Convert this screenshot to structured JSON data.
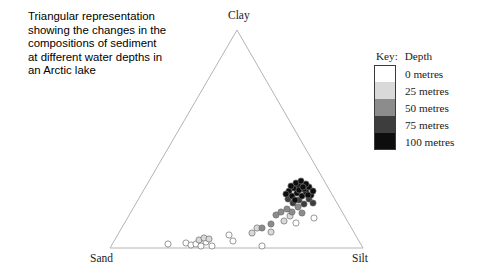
{
  "caption": {
    "lines": [
      "Triangular representation",
      "showing the changes in the",
      "compositions of sediment",
      "at different water depths in",
      "an Arctic lake"
    ]
  },
  "legend": {
    "key_label": "Key:",
    "title": "Depth",
    "entries": [
      {
        "label": "0 metres",
        "color": "#ffffff"
      },
      {
        "label": "25 metres",
        "color": "#d9d9d9"
      },
      {
        "label": "50 metres",
        "color": "#8c8c8c"
      },
      {
        "label": "75 metres",
        "color": "#3d3d3d"
      },
      {
        "label": "100 metres",
        "color": "#0d0d0d"
      }
    ]
  },
  "chart_data": {
    "type": "scatter",
    "title": "Triangular representation showing the changes in the compositions of sediment at different water depths in an Arctic lake",
    "subtype": "ternary",
    "axes": {
      "top": "Clay",
      "bottom_left": "Sand",
      "bottom_right": "Silt"
    },
    "vertex_labels": {
      "clay": "Clay",
      "sand": "Sand",
      "silt": "Silt"
    },
    "geometry": {
      "apex": [
        237,
        30
      ],
      "left": [
        110,
        248
      ],
      "right": [
        363,
        248
      ],
      "stroke": "#b4b4b4",
      "stroke_width": 1
    },
    "legend_position": "top-right",
    "grid": false,
    "marker": {
      "shape": "circle",
      "radius": 3.1,
      "edge": "#6b6b6b"
    },
    "series": [
      {
        "name": "0 metres",
        "color": "#ffffff",
        "points": [
          {
            "x": 168,
            "y": 244
          },
          {
            "x": 186,
            "y": 243
          },
          {
            "x": 191,
            "y": 245
          },
          {
            "x": 196,
            "y": 244
          },
          {
            "x": 201,
            "y": 246
          },
          {
            "x": 206,
            "y": 242
          },
          {
            "x": 212,
            "y": 246
          },
          {
            "x": 233,
            "y": 241
          },
          {
            "x": 229,
            "y": 235
          },
          {
            "x": 262,
            "y": 246
          },
          {
            "x": 296,
            "y": 223
          },
          {
            "x": 314,
            "y": 218
          }
        ]
      },
      {
        "name": "25 metres",
        "color": "#d9d9d9",
        "points": [
          {
            "x": 199,
            "y": 240
          },
          {
            "x": 204,
            "y": 238
          },
          {
            "x": 209,
            "y": 239
          },
          {
            "x": 252,
            "y": 233
          },
          {
            "x": 257,
            "y": 228
          },
          {
            "x": 271,
            "y": 232
          },
          {
            "x": 284,
            "y": 221
          },
          {
            "x": 290,
            "y": 216
          }
        ]
      },
      {
        "name": "50 metres",
        "color": "#8c8c8c",
        "points": [
          {
            "x": 262,
            "y": 228
          },
          {
            "x": 276,
            "y": 215
          },
          {
            "x": 281,
            "y": 212
          },
          {
            "x": 287,
            "y": 209
          },
          {
            "x": 292,
            "y": 212
          },
          {
            "x": 298,
            "y": 207
          },
          {
            "x": 271,
            "y": 224
          },
          {
            "x": 302,
            "y": 213
          }
        ]
      },
      {
        "name": "75 metres",
        "color": "#3d3d3d",
        "points": [
          {
            "x": 293,
            "y": 203
          },
          {
            "x": 299,
            "y": 200
          },
          {
            "x": 304,
            "y": 204
          },
          {
            "x": 288,
            "y": 199
          },
          {
            "x": 309,
            "y": 199
          },
          {
            "x": 313,
            "y": 203
          }
        ]
      },
      {
        "name": "100 metres",
        "color": "#0d0d0d",
        "points": [
          {
            "x": 292,
            "y": 196
          },
          {
            "x": 297,
            "y": 193
          },
          {
            "x": 302,
            "y": 196
          },
          {
            "x": 306,
            "y": 192
          },
          {
            "x": 311,
            "y": 195
          },
          {
            "x": 289,
            "y": 191
          },
          {
            "x": 294,
            "y": 188
          },
          {
            "x": 299,
            "y": 186
          },
          {
            "x": 304,
            "y": 189
          },
          {
            "x": 309,
            "y": 187
          },
          {
            "x": 296,
            "y": 183
          },
          {
            "x": 301,
            "y": 181
          },
          {
            "x": 306,
            "y": 184
          },
          {
            "x": 291,
            "y": 186
          },
          {
            "x": 313,
            "y": 191
          },
          {
            "x": 299,
            "y": 190
          },
          {
            "x": 303,
            "y": 187
          },
          {
            "x": 295,
            "y": 200
          },
          {
            "x": 286,
            "y": 194
          },
          {
            "x": 308,
            "y": 195
          }
        ]
      }
    ]
  }
}
